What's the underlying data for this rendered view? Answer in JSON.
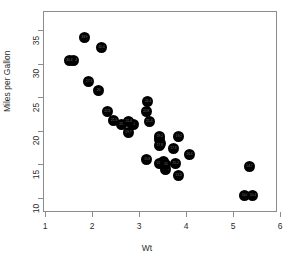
{
  "chart_data": {
    "type": "scatter",
    "title": "",
    "xlabel": "Wt",
    "ylabel": "Miles per Gallon",
    "xlim": [
      1,
      6
    ],
    "ylim": [
      9,
      36.5
    ],
    "grid": false,
    "legend": null,
    "xticks": [
      1,
      2,
      3,
      4,
      5,
      6
    ],
    "xtick_labels": [
      "1",
      "2",
      "3",
      "4",
      "5",
      "6"
    ],
    "yticks": [
      10,
      15,
      20,
      25,
      30,
      35
    ],
    "ytick_labels": [
      "10",
      "15",
      "20",
      "25",
      "30",
      "35"
    ],
    "marker": "filled-circle",
    "marker_color": "#000000",
    "marker_size": 11,
    "point_labels_visible": true,
    "points": [
      {
        "x": 2.62,
        "y": 21.0,
        "label": "21"
      },
      {
        "x": 2.875,
        "y": 21.0,
        "label": "21"
      },
      {
        "x": 2.32,
        "y": 22.8,
        "label": "22.8"
      },
      {
        "x": 3.215,
        "y": 21.4,
        "label": "21.4"
      },
      {
        "x": 3.44,
        "y": 18.7,
        "label": "18.7"
      },
      {
        "x": 3.46,
        "y": 18.1,
        "label": "18.1"
      },
      {
        "x": 3.57,
        "y": 14.3,
        "label": "14.3"
      },
      {
        "x": 3.19,
        "y": 24.4,
        "label": "24.4"
      },
      {
        "x": 3.15,
        "y": 22.8,
        "label": "22.8"
      },
      {
        "x": 3.44,
        "y": 19.2,
        "label": "19.2"
      },
      {
        "x": 3.44,
        "y": 17.8,
        "label": "17.8"
      },
      {
        "x": 4.07,
        "y": 16.4,
        "label": "16.4"
      },
      {
        "x": 3.73,
        "y": 17.3,
        "label": "17.3"
      },
      {
        "x": 3.78,
        "y": 15.2,
        "label": "15.2"
      },
      {
        "x": 5.25,
        "y": 10.4,
        "label": "10.4"
      },
      {
        "x": 5.424,
        "y": 10.4,
        "label": "10.4"
      },
      {
        "x": 5.345,
        "y": 14.7,
        "label": "14.7"
      },
      {
        "x": 2.2,
        "y": 32.4,
        "label": "32.4"
      },
      {
        "x": 1.615,
        "y": 30.4,
        "label": "30.4"
      },
      {
        "x": 1.835,
        "y": 33.9,
        "label": "33.9"
      },
      {
        "x": 2.465,
        "y": 21.5,
        "label": "21.5"
      },
      {
        "x": 3.52,
        "y": 15.5,
        "label": "15.5"
      },
      {
        "x": 3.435,
        "y": 15.2,
        "label": "15.2"
      },
      {
        "x": 3.84,
        "y": 13.3,
        "label": "13.3"
      },
      {
        "x": 3.845,
        "y": 19.2,
        "label": "19.2"
      },
      {
        "x": 1.935,
        "y": 27.3,
        "label": "27.3"
      },
      {
        "x": 2.14,
        "y": 26.0,
        "label": "26"
      },
      {
        "x": 1.513,
        "y": 30.4,
        "label": "30.4"
      },
      {
        "x": 3.17,
        "y": 15.8,
        "label": "15.8"
      },
      {
        "x": 2.77,
        "y": 19.7,
        "label": "19.7"
      },
      {
        "x": 3.57,
        "y": 15.0,
        "label": "15"
      },
      {
        "x": 2.78,
        "y": 21.4,
        "label": "21.4"
      }
    ]
  },
  "geometry": {
    "plot_left": 43,
    "plot_right": 277,
    "plot_top": 11,
    "plot_bottom": 212,
    "x_value_at_left_px": 1,
    "px_per_x_unit": 47,
    "x_origin_px": 45,
    "y_value_at_35_px": 30,
    "px_per_5_mpg": 33.6
  },
  "colors": {
    "background": "#ffffff",
    "frame": "#8c8c8c",
    "marker": "#000000",
    "text": "#2b2b2b",
    "marker_label": "#6a6a6a"
  }
}
